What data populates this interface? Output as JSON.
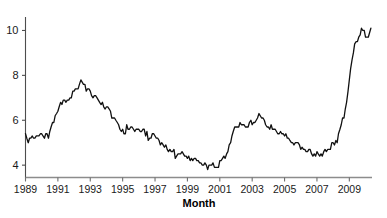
{
  "chart_data": {
    "type": "line",
    "title": "",
    "xlabel": "Month",
    "ylabel": "",
    "xlim": [
      1989.0,
      2010.4
    ],
    "ylim": [
      3.45,
      10.6
    ],
    "grid": false,
    "legend": null,
    "xtick_labels": [
      "1989",
      "1991",
      "1993",
      "1995",
      "1997",
      "1999",
      "2001",
      "2003",
      "2005",
      "2007",
      "2009"
    ],
    "xtick_values": [
      1989,
      1991,
      1993,
      1995,
      1997,
      1999,
      2001,
      2003,
      2005,
      2007,
      2009
    ],
    "ytick_labels": [
      "4",
      "6",
      "8",
      "10"
    ],
    "ytick_values": [
      4,
      6,
      8,
      10
    ],
    "series": [
      {
        "name": "Unemployment rate",
        "color": "#111111",
        "x": [
          1989.0,
          1989.08,
          1989.17,
          1989.25,
          1989.33,
          1989.42,
          1989.5,
          1989.58,
          1989.67,
          1989.75,
          1989.83,
          1989.92,
          1990.0,
          1990.08,
          1990.17,
          1990.25,
          1990.33,
          1990.42,
          1990.5,
          1990.58,
          1990.67,
          1990.75,
          1990.83,
          1990.92,
          1991.0,
          1991.08,
          1991.17,
          1991.25,
          1991.33,
          1991.42,
          1991.5,
          1991.58,
          1991.67,
          1991.75,
          1991.83,
          1991.92,
          1992.0,
          1992.08,
          1992.17,
          1992.25,
          1992.33,
          1992.42,
          1992.5,
          1992.58,
          1992.67,
          1992.75,
          1992.83,
          1992.92,
          1993.0,
          1993.08,
          1993.17,
          1993.25,
          1993.33,
          1993.42,
          1993.5,
          1993.58,
          1993.67,
          1993.75,
          1993.83,
          1993.92,
          1994.0,
          1994.08,
          1994.17,
          1994.25,
          1994.33,
          1994.42,
          1994.5,
          1994.58,
          1994.67,
          1994.75,
          1994.83,
          1994.92,
          1995.0,
          1995.08,
          1995.17,
          1995.25,
          1995.33,
          1995.42,
          1995.5,
          1995.58,
          1995.67,
          1995.75,
          1995.83,
          1995.92,
          1996.0,
          1996.08,
          1996.17,
          1996.25,
          1996.33,
          1996.42,
          1996.5,
          1996.58,
          1996.67,
          1996.75,
          1996.83,
          1996.92,
          1997.0,
          1997.08,
          1997.17,
          1997.25,
          1997.33,
          1997.42,
          1997.5,
          1997.58,
          1997.67,
          1997.75,
          1997.83,
          1997.92,
          1998.0,
          1998.08,
          1998.17,
          1998.25,
          1998.33,
          1998.42,
          1998.5,
          1998.58,
          1998.67,
          1998.75,
          1998.83,
          1998.92,
          1999.0,
          1999.08,
          1999.17,
          1999.25,
          1999.33,
          1999.42,
          1999.5,
          1999.58,
          1999.67,
          1999.75,
          1999.83,
          1999.92,
          2000.0,
          2000.08,
          2000.17,
          2000.25,
          2000.33,
          2000.42,
          2000.5,
          2000.58,
          2000.67,
          2000.75,
          2000.83,
          2000.92,
          2001.0,
          2001.08,
          2001.17,
          2001.25,
          2001.33,
          2001.42,
          2001.5,
          2001.58,
          2001.67,
          2001.75,
          2001.83,
          2001.92,
          2002.0,
          2002.08,
          2002.17,
          2002.25,
          2002.33,
          2002.42,
          2002.5,
          2002.58,
          2002.67,
          2002.75,
          2002.83,
          2002.92,
          2003.0,
          2003.08,
          2003.17,
          2003.25,
          2003.33,
          2003.42,
          2003.5,
          2003.58,
          2003.67,
          2003.75,
          2003.83,
          2003.92,
          2004.0,
          2004.08,
          2004.17,
          2004.25,
          2004.33,
          2004.42,
          2004.5,
          2004.58,
          2004.67,
          2004.75,
          2004.83,
          2004.92,
          2005.0,
          2005.08,
          2005.17,
          2005.25,
          2005.33,
          2005.42,
          2005.5,
          2005.58,
          2005.67,
          2005.75,
          2005.83,
          2005.92,
          2006.0,
          2006.08,
          2006.17,
          2006.25,
          2006.33,
          2006.42,
          2006.5,
          2006.58,
          2006.67,
          2006.75,
          2006.83,
          2006.92,
          2007.0,
          2007.08,
          2007.17,
          2007.25,
          2007.33,
          2007.42,
          2007.5,
          2007.58,
          2007.67,
          2007.75,
          2007.83,
          2007.92,
          2008.0,
          2008.08,
          2008.17,
          2008.25,
          2008.33,
          2008.42,
          2008.5,
          2008.58,
          2008.67,
          2008.75,
          2008.83,
          2008.92,
          2009.0,
          2009.08,
          2009.17,
          2009.25,
          2009.33,
          2009.42,
          2009.5,
          2009.58,
          2009.67,
          2009.75,
          2009.83,
          2009.92,
          2010.0,
          2010.08,
          2010.17,
          2010.25,
          2010.33
        ],
        "y": [
          5.4,
          5.2,
          5.0,
          5.2,
          5.2,
          5.3,
          5.2,
          5.2,
          5.3,
          5.3,
          5.3,
          5.4,
          5.4,
          5.3,
          5.2,
          5.4,
          5.4,
          5.2,
          5.5,
          5.7,
          5.9,
          5.9,
          6.2,
          6.3,
          6.4,
          6.6,
          6.8,
          6.7,
          6.9,
          6.9,
          6.8,
          6.9,
          6.9,
          7.0,
          7.0,
          7.3,
          7.3,
          7.4,
          7.4,
          7.4,
          7.6,
          7.8,
          7.7,
          7.6,
          7.6,
          7.3,
          7.4,
          7.4,
          7.3,
          7.1,
          7.0,
          7.1,
          7.1,
          7.0,
          6.9,
          6.8,
          6.7,
          6.8,
          6.6,
          6.5,
          6.6,
          6.6,
          6.5,
          6.4,
          6.1,
          6.1,
          6.1,
          6.0,
          5.9,
          5.8,
          5.6,
          5.5,
          5.6,
          5.4,
          5.4,
          5.8,
          5.6,
          5.6,
          5.7,
          5.7,
          5.6,
          5.5,
          5.6,
          5.6,
          5.6,
          5.5,
          5.5,
          5.6,
          5.6,
          5.3,
          5.5,
          5.1,
          5.2,
          5.2,
          5.4,
          5.4,
          5.3,
          5.2,
          5.2,
          5.1,
          4.9,
          5.0,
          4.9,
          4.8,
          4.9,
          4.7,
          4.6,
          4.7,
          4.6,
          4.6,
          4.7,
          4.3,
          4.4,
          4.5,
          4.5,
          4.5,
          4.6,
          4.5,
          4.4,
          4.4,
          4.3,
          4.4,
          4.2,
          4.3,
          4.2,
          4.3,
          4.3,
          4.2,
          4.2,
          4.1,
          4.1,
          4.0,
          4.0,
          4.1,
          4.0,
          3.8,
          4.0,
          4.0,
          4.0,
          4.1,
          3.9,
          3.9,
          3.9,
          3.9,
          4.2,
          4.2,
          4.3,
          4.4,
          4.3,
          4.5,
          4.6,
          4.9,
          5.0,
          5.3,
          5.5,
          5.7,
          5.7,
          5.7,
          5.7,
          5.9,
          5.8,
          5.8,
          5.8,
          5.7,
          5.7,
          5.7,
          5.9,
          6.0,
          5.8,
          5.9,
          5.9,
          6.0,
          6.1,
          6.3,
          6.2,
          6.1,
          6.1,
          6.0,
          5.8,
          5.7,
          5.7,
          5.6,
          5.8,
          5.6,
          5.6,
          5.6,
          5.5,
          5.4,
          5.4,
          5.5,
          5.4,
          5.4,
          5.3,
          5.4,
          5.2,
          5.2,
          5.1,
          5.0,
          5.0,
          4.9,
          5.0,
          5.0,
          5.0,
          4.9,
          4.7,
          4.8,
          4.7,
          4.7,
          4.6,
          4.6,
          4.7,
          4.7,
          4.5,
          4.4,
          4.5,
          4.4,
          4.6,
          4.5,
          4.4,
          4.5,
          4.4,
          4.6,
          4.7,
          4.6,
          4.7,
          4.7,
          4.7,
          5.0,
          5.0,
          4.9,
          5.1,
          5.0,
          5.4,
          5.6,
          5.8,
          6.1,
          6.1,
          6.5,
          6.8,
          7.3,
          7.8,
          8.3,
          8.7,
          9.0,
          9.4,
          9.5,
          9.5,
          9.7,
          9.8,
          10.1,
          10.0,
          10.0,
          9.7,
          9.7,
          9.7,
          9.9,
          10.1
        ]
      }
    ]
  },
  "figure": {
    "axis_title": "Month"
  }
}
